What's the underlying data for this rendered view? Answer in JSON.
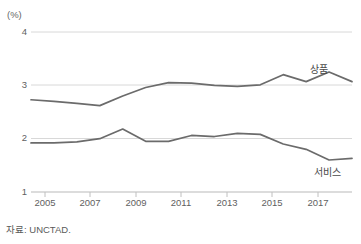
{
  "chart_data": {
    "type": "line",
    "title": "",
    "xlabel": "",
    "ylabel": "(%)",
    "ylim": [
      1,
      4
    ],
    "xlim": [
      2004,
      2018
    ],
    "yticks": [
      4,
      3,
      2,
      1
    ],
    "xticks": [
      2005,
      2007,
      2009,
      2011,
      2013,
      2015,
      2017
    ],
    "grid": true,
    "legend_position": "inline-right",
    "x": [
      2004,
      2005,
      2006,
      2007,
      2008,
      2009,
      2010,
      2011,
      2012,
      2013,
      2014,
      2015,
      2016,
      2017,
      2018
    ],
    "series": [
      {
        "name": "상품",
        "color": "#6b6b6b",
        "values": [
          2.73,
          2.7,
          2.66,
          2.62,
          2.8,
          2.96,
          3.05,
          3.04,
          3.0,
          2.98,
          3.01,
          3.2,
          3.07,
          3.25,
          3.07
        ]
      },
      {
        "name": "서비스",
        "color": "#6b6b6b",
        "values": [
          1.92,
          1.92,
          1.94,
          2.0,
          2.18,
          1.95,
          1.95,
          2.06,
          2.04,
          2.1,
          2.08,
          1.9,
          1.8,
          1.6,
          1.63
        ]
      }
    ],
    "annotations": [
      {
        "text": "상품",
        "x": 2016.6,
        "y": 3.35
      },
      {
        "text": "서비스",
        "x": 2016.8,
        "y": 1.42
      }
    ],
    "source": "자료: UNCTAD."
  },
  "axis": {
    "unit_label": "(%)",
    "ytick_labels": [
      "4",
      "3",
      "2",
      "1"
    ],
    "xtick_labels": [
      "2005",
      "2007",
      "2009",
      "2011",
      "2013",
      "2015",
      "2017"
    ]
  },
  "footer": {
    "source": "자료: UNCTAD."
  },
  "colors": {
    "line": "#6b6b6b",
    "grid": "#d8d8d8",
    "axis_text": "#5f5f5f"
  }
}
